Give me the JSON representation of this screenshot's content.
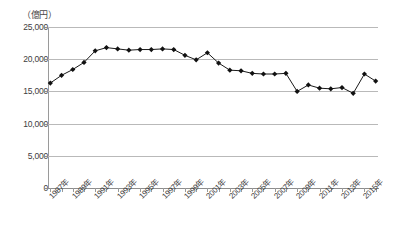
{
  "chart_data": {
    "type": "line",
    "title": "",
    "subtitle": "",
    "xlabel": "",
    "ylabel": "",
    "unit_label": "（億円）",
    "grid": true,
    "legend": "none",
    "ylim": [
      0,
      25000
    ],
    "ytick_labels": [
      "25,000",
      "20,000",
      "15,000",
      "10,000",
      "5,000",
      "0"
    ],
    "ytick_values": [
      25000,
      20000,
      15000,
      10000,
      5000,
      0
    ],
    "xtick_labels": [
      "1987年",
      "1989年",
      "1991年",
      "1993年",
      "1995年",
      "1997年",
      "1999年",
      "2001年",
      "2003年",
      "2005年",
      "2007年",
      "2009年",
      "2011年",
      "2013年",
      "2015年"
    ],
    "x": [
      1987,
      1988,
      1989,
      1990,
      1991,
      1992,
      1993,
      1994,
      1995,
      1996,
      1997,
      1998,
      1999,
      2000,
      2001,
      2002,
      2003,
      2004,
      2005,
      2006,
      2007,
      2008,
      2009,
      2010,
      2011,
      2012,
      2013,
      2014,
      2015,
      2016
    ],
    "categories": [
      "1987年",
      "1988年",
      "1989年",
      "1990年",
      "1991年",
      "1992年",
      "1993年",
      "1994年",
      "1995年",
      "1996年",
      "1997年",
      "1998年",
      "1999年",
      "2000年",
      "2001年",
      "2002年",
      "2003年",
      "2004年",
      "2005年",
      "2006年",
      "2007年",
      "2008年",
      "2009年",
      "2010年",
      "2011年",
      "2012年",
      "2013年",
      "2014年",
      "2015年",
      "2016年"
    ],
    "values": [
      16300,
      17500,
      18400,
      19500,
      21300,
      21800,
      21600,
      21400,
      21500,
      21500,
      21600,
      21500,
      20600,
      19900,
      21000,
      19400,
      18300,
      18200,
      17800,
      17700,
      17700,
      17800,
      15000,
      16000,
      15500,
      15400,
      15600,
      14700,
      17700,
      16600
    ],
    "series": [
      {
        "name": "金額",
        "values": [
          16300,
          17500,
          18400,
          19500,
          21300,
          21800,
          21600,
          21400,
          21500,
          21500,
          21600,
          21500,
          20600,
          19900,
          21000,
          19400,
          18300,
          18200,
          17800,
          17700,
          17700,
          17800,
          15000,
          16000,
          15500,
          15400,
          15600,
          14700,
          17700,
          16600
        ]
      }
    ],
    "colors": {
      "line": "#1a1a1a",
      "marker": "#111111",
      "grid": "#b9b9b9",
      "axis": "#8d8d8d",
      "text": "#3d3d3d"
    }
  }
}
